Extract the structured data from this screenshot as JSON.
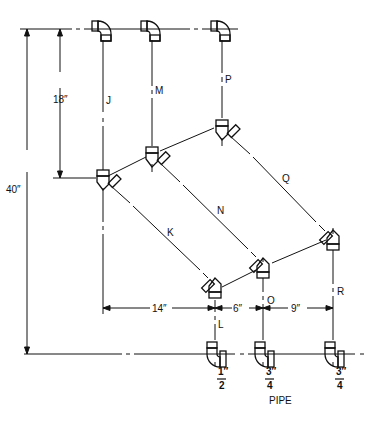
{
  "diagram": {
    "type": "piping-offset-drawing",
    "colors": {
      "line": "#111111",
      "background": "#ffffff"
    },
    "pipe_labels": {
      "J": "J",
      "M": "M",
      "P": "P",
      "K": "K",
      "N": "N",
      "Q": "Q",
      "L": "L",
      "O": "O",
      "R": "R"
    },
    "dimensions": {
      "total_height": "40″",
      "upper_height": "18″",
      "left_span": "14″",
      "mid_span": "6″",
      "right_span": "9″"
    },
    "pipe_sizes": [
      {
        "num": "1″",
        "den": "2"
      },
      {
        "num": "3″",
        "den": "4"
      },
      {
        "num": "3″",
        "den": "4"
      }
    ],
    "pipe_caption": "PIPE"
  }
}
